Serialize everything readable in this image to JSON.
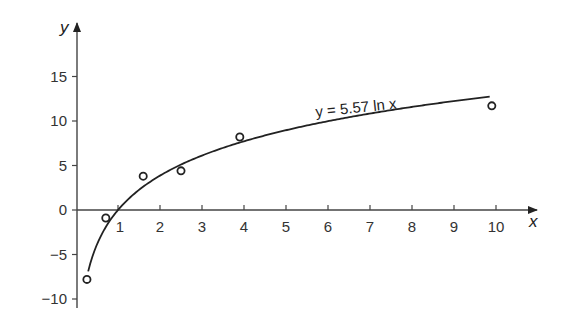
{
  "chart_data": {
    "type": "scatter",
    "title": "",
    "xlabel": "x",
    "ylabel": "y",
    "xlim": [
      0,
      11
    ],
    "ylim": [
      -11,
      19
    ],
    "x_ticks": [
      1,
      2,
      3,
      4,
      5,
      6,
      7,
      8,
      9,
      10
    ],
    "y_ticks": [
      -10,
      -5,
      0,
      5,
      10,
      15
    ],
    "grid": false,
    "legend": null,
    "series": [
      {
        "name": "data points",
        "type": "scatter",
        "marker": "open-circle",
        "points": [
          {
            "x": 0.26,
            "y": -7.8
          },
          {
            "x": 0.71,
            "y": -0.9
          },
          {
            "x": 1.6,
            "y": 3.8
          },
          {
            "x": 2.5,
            "y": 4.4
          },
          {
            "x": 3.9,
            "y": 8.2
          },
          {
            "x": 9.9,
            "y": 11.7
          }
        ]
      },
      {
        "name": "y = 5.57 ln x",
        "type": "line",
        "function": "5.57*ln(x)",
        "x_range": [
          0.29,
          9.85
        ]
      }
    ],
    "annotations": [
      {
        "text": "y = 5.57 ln x",
        "x": 6.9,
        "y": 13.5
      }
    ]
  },
  "labels": {
    "x_axis": "x",
    "y_axis": "y",
    "equation": "y = 5.57 ln x"
  },
  "colors": {
    "ink": "#222222",
    "text": "#333333",
    "background": "#ffffff"
  }
}
